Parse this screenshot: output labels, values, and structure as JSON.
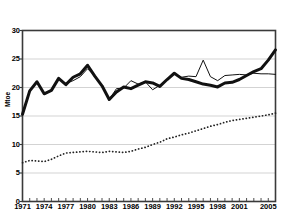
{
  "chart_data": {
    "type": "line",
    "title": "",
    "xlabel": "",
    "ylabel": "Mtoe",
    "xlim": [
      1971,
      2006
    ],
    "ylim": [
      0,
      30
    ],
    "grid": true,
    "legend": "none",
    "y_ticks": [
      0,
      5,
      10,
      15,
      20,
      25,
      30
    ],
    "x_ticks": [
      1971,
      1974,
      1977,
      1980,
      1983,
      1986,
      1989,
      1992,
      1995,
      1998,
      2001,
      2005
    ],
    "x": [
      1971,
      1972,
      1973,
      1974,
      1975,
      1976,
      1977,
      1978,
      1979,
      1980,
      1981,
      1982,
      1983,
      1984,
      1985,
      1986,
      1987,
      1988,
      1989,
      1990,
      1991,
      1992,
      1993,
      1994,
      1995,
      1996,
      1997,
      1998,
      1999,
      2000,
      2001,
      2002,
      2003,
      2004,
      2005,
      2006
    ],
    "series": [
      {
        "name": "thick-solid-series",
        "style": "thick-solid",
        "color": "#111111",
        "values": [
          15.3,
          19.4,
          21.0,
          18.9,
          19.5,
          21.6,
          20.5,
          21.8,
          22.4,
          23.9,
          22.0,
          20.3,
          17.9,
          19.2,
          20.1,
          19.8,
          20.4,
          21.0,
          20.8,
          20.2,
          21.4,
          22.5,
          21.6,
          21.4,
          21.0,
          20.6,
          20.4,
          20.1,
          20.8,
          20.9,
          21.4,
          22.1,
          22.8,
          23.3,
          24.8,
          26.6
        ]
      },
      {
        "name": "thin-solid-series",
        "style": "thin-solid",
        "color": "#111111",
        "values": [
          15.3,
          19.4,
          21.0,
          18.8,
          19.5,
          21.5,
          20.7,
          21.2,
          21.9,
          23.3,
          22.0,
          20.3,
          17.9,
          19.8,
          19.9,
          21.2,
          20.6,
          21.0,
          19.6,
          20.4,
          21.4,
          22.4,
          21.8,
          22.0,
          21.9,
          24.8,
          21.9,
          21.2,
          22.1,
          22.2,
          22.3,
          22.2,
          22.5,
          22.4,
          22.4,
          22.3
        ]
      },
      {
        "name": "dotted-series",
        "style": "dotted",
        "color": "#222222",
        "values": [
          6.8,
          7.2,
          7.1,
          7.0,
          7.4,
          8.0,
          8.5,
          8.6,
          8.7,
          8.8,
          8.7,
          8.6,
          8.8,
          8.7,
          8.6,
          8.8,
          9.2,
          9.5,
          10.0,
          10.4,
          11.0,
          11.3,
          11.7,
          12.0,
          12.4,
          12.8,
          13.2,
          13.5,
          13.9,
          14.2,
          14.4,
          14.6,
          14.8,
          15.0,
          15.2,
          15.5
        ]
      }
    ]
  }
}
